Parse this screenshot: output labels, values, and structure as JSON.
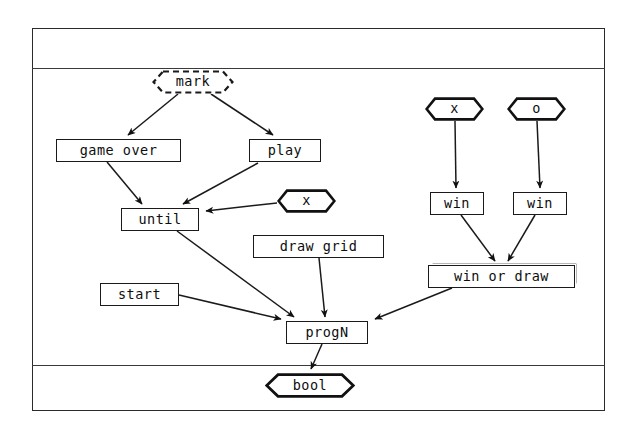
{
  "diagram": {
    "type": "dataflow-swimlane",
    "title": "",
    "lanes": [
      {
        "name": "lane-top",
        "label": ""
      },
      {
        "name": "lane-middle",
        "label": ""
      },
      {
        "name": "lane-bottom",
        "label": ""
      }
    ],
    "nodes": [
      {
        "id": "mark",
        "label": "mark",
        "shape": "hexagon-dashed",
        "x": 152,
        "y": 70,
        "w": 82,
        "h": 24
      },
      {
        "id": "game_over",
        "label": "game over",
        "shape": "box",
        "x": 56,
        "y": 139,
        "w": 125,
        "h": 23
      },
      {
        "id": "play",
        "label": "play",
        "shape": "box",
        "x": 249,
        "y": 139,
        "w": 72,
        "h": 23
      },
      {
        "id": "x_until",
        "label": "x",
        "shape": "hexagon",
        "x": 277,
        "y": 189,
        "w": 59,
        "h": 24
      },
      {
        "id": "until",
        "label": "until",
        "shape": "box",
        "x": 121,
        "y": 208,
        "w": 78,
        "h": 23
      },
      {
        "id": "draw_grid",
        "label": "draw grid",
        "shape": "box",
        "x": 253,
        "y": 235,
        "w": 131,
        "h": 23
      },
      {
        "id": "start",
        "label": "start",
        "shape": "box",
        "x": 100,
        "y": 283,
        "w": 79,
        "h": 23
      },
      {
        "id": "progN",
        "label": "progN",
        "shape": "box",
        "x": 286,
        "y": 321,
        "w": 82,
        "h": 23
      },
      {
        "id": "x_win",
        "label": "x",
        "shape": "hexagon",
        "x": 425,
        "y": 97,
        "w": 59,
        "h": 24
      },
      {
        "id": "o_win",
        "label": "o",
        "shape": "hexagon",
        "x": 507,
        "y": 97,
        "w": 59,
        "h": 24
      },
      {
        "id": "win_left",
        "label": "win",
        "shape": "box",
        "x": 430,
        "y": 192,
        "w": 54,
        "h": 23
      },
      {
        "id": "win_right",
        "label": "win",
        "shape": "box",
        "x": 513,
        "y": 192,
        "w": 54,
        "h": 23
      },
      {
        "id": "win_or_draw",
        "label": "win or draw",
        "shape": "box-shadowed",
        "x": 428,
        "y": 265,
        "w": 147,
        "h": 23
      },
      {
        "id": "bool",
        "label": "bool",
        "shape": "hexagon",
        "x": 265,
        "y": 373,
        "w": 90,
        "h": 25
      }
    ],
    "edges": [
      {
        "from": "mark",
        "to": "game_over"
      },
      {
        "from": "mark",
        "to": "play"
      },
      {
        "from": "game_over",
        "to": "until"
      },
      {
        "from": "play",
        "to": "until"
      },
      {
        "from": "x_until",
        "to": "until"
      },
      {
        "from": "until",
        "to": "progN"
      },
      {
        "from": "draw_grid",
        "to": "progN"
      },
      {
        "from": "start",
        "to": "progN"
      },
      {
        "from": "win_or_draw",
        "to": "progN"
      },
      {
        "from": "x_win",
        "to": "win_left"
      },
      {
        "from": "o_win",
        "to": "win_right"
      },
      {
        "from": "win_left",
        "to": "win_or_draw"
      },
      {
        "from": "win_right",
        "to": "win_or_draw"
      },
      {
        "from": "progN",
        "to": "bool"
      }
    ],
    "colors": {
      "stroke": "#1a1a1a",
      "frame": "#2b2b2b",
      "background": "#ffffff",
      "text": "#0d0d0d"
    }
  }
}
